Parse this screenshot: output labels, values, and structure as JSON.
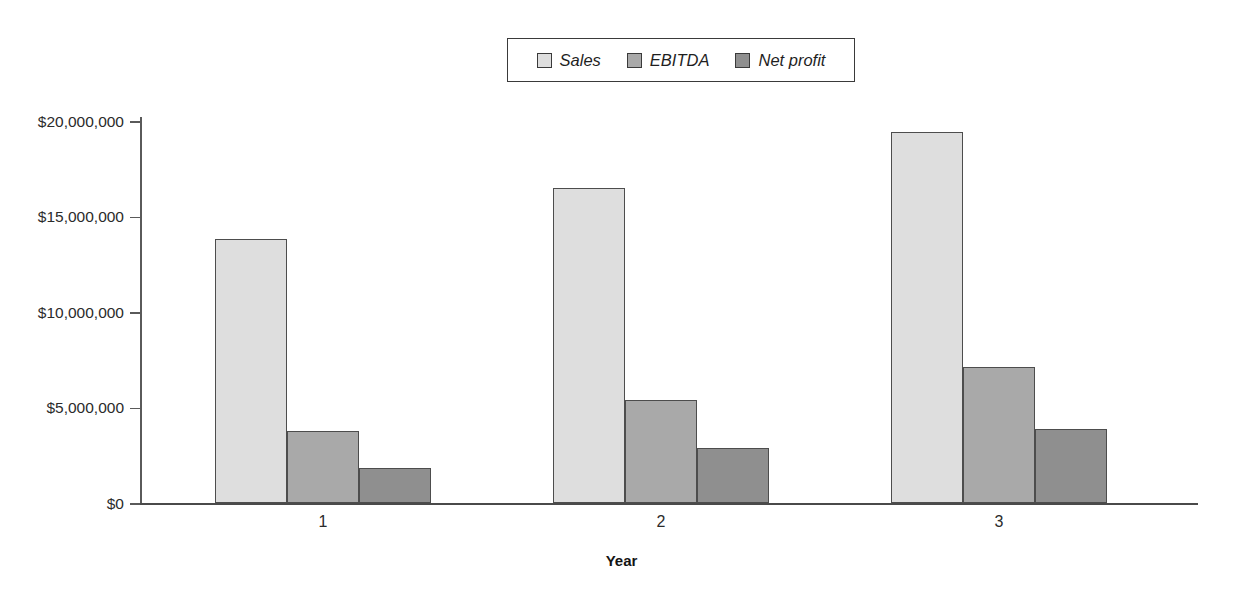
{
  "chart_data": {
    "type": "bar",
    "title": "",
    "subtitle": "",
    "xlabel": "Year",
    "ylabel": "",
    "categories": [
      "1",
      "2",
      "3"
    ],
    "series": [
      {
        "name": "Sales",
        "values": [
          13800000,
          16500000,
          19400000
        ],
        "color": "#dedede"
      },
      {
        "name": "EBITDA",
        "values": [
          3770000,
          5400000,
          7100000
        ],
        "color": "#a9a9a9"
      },
      {
        "name": "Net profit",
        "values": [
          1830000,
          2900000,
          3900000
        ],
        "color": "#8f8f8f"
      }
    ],
    "ylim": [
      0,
      20000000
    ],
    "yticks": [
      0,
      5000000,
      10000000,
      15000000,
      20000000
    ],
    "ytick_labels": [
      "$0",
      "$5,000,000",
      "$10,000,000",
      "$15,000,000",
      "$20,000,000"
    ],
    "grid": false,
    "legend_position": "top-center",
    "legend_entries": [
      "Sales",
      "EBITDA",
      "Net profit"
    ],
    "annotations": []
  },
  "legend": {
    "items": [
      {
        "label": "Sales"
      },
      {
        "label": "EBITDA"
      },
      {
        "label": "Net profit"
      }
    ]
  },
  "axes": {
    "x_title": "Year"
  }
}
